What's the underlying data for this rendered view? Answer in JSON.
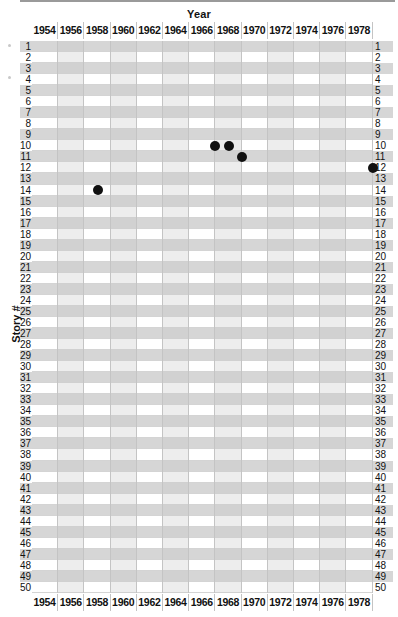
{
  "chart_data": {
    "type": "scatter",
    "title": "",
    "xlabel": "Year",
    "ylabel": "Story #",
    "x_ticks": [
      "1954",
      "1956",
      "1958",
      "1960",
      "1962",
      "1964",
      "1966",
      "1968",
      "1970",
      "1972",
      "1974",
      "1976",
      "1978"
    ],
    "y_ticks": [
      1,
      2,
      3,
      4,
      5,
      6,
      7,
      8,
      9,
      10,
      11,
      12,
      13,
      14,
      15,
      16,
      17,
      18,
      19,
      20,
      21,
      22,
      23,
      24,
      25,
      26,
      27,
      28,
      29,
      30,
      31,
      32,
      33,
      34,
      35,
      36,
      37,
      38,
      39,
      40,
      41,
      42,
      43,
      44,
      45,
      46,
      47,
      48,
      49,
      50
    ],
    "xlim": [
      1953,
      1979
    ],
    "ylim": [
      1,
      50
    ],
    "y_inverted": true,
    "grid": true,
    "legend": null,
    "points": [
      {
        "x": 1967,
        "y": 10
      },
      {
        "x": 1968,
        "y": 10
      },
      {
        "x": 1969,
        "y": 11
      },
      {
        "x": 1979,
        "y": 12
      },
      {
        "x": 1958,
        "y": 14
      }
    ]
  },
  "labels": {
    "x_title": "Year",
    "y_title": "Story #"
  }
}
